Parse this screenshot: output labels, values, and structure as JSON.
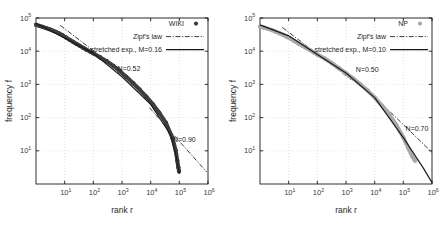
{
  "figure": {
    "panels": [
      {
        "id": "left",
        "axes": {
          "xlabel": "rank r",
          "ylabel": "frequency f",
          "xticks": [
            "10",
            "10",
            "10",
            "10",
            "10",
            "10"
          ],
          "xtick_exponents": [
            "1",
            "2",
            "3",
            "4",
            "5",
            "6"
          ],
          "yticks": [
            "10",
            "10",
            "10",
            "10",
            "10"
          ],
          "ytick_exponents": [
            "1",
            "2",
            "3",
            "4",
            "5"
          ]
        },
        "legend": {
          "data_label": "WIKI",
          "zipf_label": "Zipf's law",
          "stretched_label": "stretched exp., M=0.16"
        },
        "annotations": [
          {
            "text": "N=0.52"
          },
          {
            "text": "N=0.90"
          }
        ]
      },
      {
        "id": "right",
        "axes": {
          "xlabel": "rank r",
          "ylabel": "frequency f",
          "xticks": [
            "10",
            "10",
            "10",
            "10",
            "10",
            "10"
          ],
          "xtick_exponents": [
            "1",
            "2",
            "3",
            "4",
            "5",
            "6"
          ],
          "yticks": [
            "10",
            "10",
            "10",
            "10",
            "10"
          ],
          "ytick_exponents": [
            "1",
            "2",
            "3",
            "4",
            "5"
          ]
        },
        "legend": {
          "data_label": "NP",
          "zipf_label": "Zipf's law",
          "stretched_label": "stretched exp., M=0.10"
        },
        "annotations": [
          {
            "text": "N=0.50"
          },
          {
            "text": "N=0.70"
          }
        ]
      }
    ]
  },
  "colors": {
    "wiki_marker": "#3d3d3d",
    "np_marker": "#a9a9a9",
    "fit_line": "#1a1a1a",
    "zipf_line": "#1a1a1a",
    "grid": "#d0d0d0",
    "frame": "#1a1a1a"
  },
  "chart_data": [
    {
      "type": "scatter",
      "panel": "left",
      "title": "",
      "xlabel": "rank r",
      "ylabel": "frequency f",
      "xscale": "log",
      "yscale": "log",
      "xlim": [
        1,
        1000000
      ],
      "ylim": [
        1,
        100000
      ],
      "grid": true,
      "legend_position": "top-right",
      "series": [
        {
          "name": "WIKI",
          "type": "scatter",
          "marker": "circle",
          "color": "#3d3d3d",
          "x": [
            1,
            1.3,
            1.7,
            2.2,
            2.9,
            3.8,
            5,
            6.5,
            8.5,
            11,
            15,
            20,
            26,
            34,
            45,
            58,
            76,
            100,
            170,
            290,
            500,
            850,
            1400,
            2400,
            4100,
            7000,
            12000,
            20000,
            34000,
            58000,
            75000,
            85000,
            92000,
            98000
          ],
          "y": [
            62000,
            58000,
            54000,
            50000,
            46000,
            42000,
            38000,
            34000,
            30000,
            26000,
            22000,
            19000,
            16500,
            14500,
            12500,
            11000,
            9800,
            8600,
            6600,
            5000,
            3600,
            2500,
            1700,
            1100,
            700,
            430,
            250,
            140,
            70,
            24,
            10,
            5,
            3.2,
            2.4
          ]
        },
        {
          "name": "stretched exp., M=0.16",
          "type": "line",
          "style": "solid",
          "color": "#1a1a1a",
          "x": [
            1,
            10,
            100,
            1000,
            10000,
            50000,
            80000,
            100000
          ],
          "y": [
            70000,
            25000,
            8600,
            1700,
            250,
            30,
            6,
            2.0
          ]
        },
        {
          "name": "Zipf's law",
          "type": "line",
          "style": "dashdot",
          "color": "#1a1a1a",
          "note": "two reference slopes",
          "segments": [
            {
              "label": "N=0.52",
              "x": [
                7,
                3000
              ],
              "y": [
                60000,
                1100
              ]
            },
            {
              "label": "N=0.90",
              "x": [
                9000,
                900000
              ],
              "y": [
                200,
                2.3
              ]
            }
          ]
        }
      ],
      "annotations": [
        {
          "text": "N=0.52",
          "x": 700,
          "y": 2600
        },
        {
          "text": "N=0.90",
          "x": 60000,
          "y": 18
        }
      ]
    },
    {
      "type": "scatter",
      "panel": "right",
      "title": "",
      "xlabel": "rank r",
      "ylabel": "frequency f",
      "xscale": "log",
      "yscale": "log",
      "xlim": [
        1,
        1000000
      ],
      "ylim": [
        1,
        100000
      ],
      "grid": true,
      "legend_position": "top-right",
      "series": [
        {
          "name": "NP",
          "type": "scatter",
          "marker": "circle",
          "color": "#a9a9a9",
          "x": [
            1,
            1.4,
            1.9,
            2.6,
            3.5,
            4.7,
            6.4,
            8.7,
            12,
            16,
            22,
            30,
            41,
            55,
            75,
            100,
            180,
            320,
            570,
            1000,
            1800,
            3200,
            5700,
            10000,
            18000,
            32000,
            57000,
            100000,
            150000,
            200000,
            240000,
            260000
          ],
          "y": [
            55000,
            51000,
            47000,
            43000,
            39000,
            35000,
            31000,
            27000,
            23500,
            20000,
            17000,
            14500,
            12500,
            10800,
            9200,
            8000,
            6000,
            4400,
            3100,
            2200,
            1500,
            1000,
            650,
            400,
            230,
            125,
            60,
            25,
            12,
            7,
            5.5,
            5.0
          ]
        },
        {
          "name": "stretched exp., M=0.10",
          "type": "line",
          "style": "solid",
          "color": "#1a1a1a",
          "x": [
            1,
            10,
            100,
            1000,
            10000,
            100000,
            500000,
            1000000
          ],
          "y": [
            62000,
            29000,
            8000,
            2200,
            400,
            25,
            3.0,
            1.1
          ]
        },
        {
          "name": "Zipf's law",
          "type": "line",
          "style": "dashdot",
          "color": "#1a1a1a",
          "note": "two reference slopes",
          "segments": [
            {
              "label": "N=0.50",
              "x": [
                6,
                1500
              ],
              "y": [
                52000,
                1400
              ]
            },
            {
              "label": "N=0.70",
              "x": [
                4000,
                1000000
              ],
              "y": [
                900,
                9
              ]
            }
          ]
        }
      ],
      "annotations": [
        {
          "text": "N=0.50",
          "x": 2200,
          "y": 2400
        },
        {
          "text": "N=0.70",
          "x": 120000,
          "y": 40
        }
      ]
    }
  ]
}
